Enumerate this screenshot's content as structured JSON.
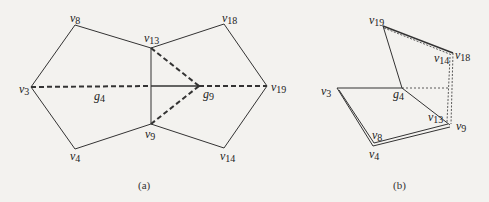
{
  "figure": {
    "panels": [
      {
        "id": "a",
        "caption": "(a)",
        "vertices": {
          "v8": {
            "label": "v",
            "sub": "8",
            "x": 75,
            "y": 25
          },
          "v13": {
            "label": "v",
            "sub": "13",
            "x": 151,
            "y": 48
          },
          "v18": {
            "label": "v",
            "sub": "18",
            "x": 224,
            "y": 24
          },
          "v3": {
            "label": "v",
            "sub": "3",
            "x": 31,
            "y": 87
          },
          "g9": {
            "label": "g",
            "sub": "9",
            "x": 199,
            "y": 86
          },
          "v19": {
            "label": "v",
            "sub": "19",
            "x": 267,
            "y": 86
          },
          "v9": {
            "label": "v",
            "sub": "9",
            "x": 151,
            "y": 124
          },
          "v4": {
            "label": "v",
            "sub": "4",
            "x": 75,
            "y": 149
          },
          "v14": {
            "label": "v",
            "sub": "14",
            "x": 224,
            "y": 148
          },
          "g4": {
            "label": "g",
            "sub": "4"
          }
        },
        "solid_edges": [
          [
            "v3",
            "v8"
          ],
          [
            "v8",
            "v13"
          ],
          [
            "v13",
            "v18"
          ],
          [
            "v18",
            "v19"
          ],
          [
            "v19",
            "v14"
          ],
          [
            "v14",
            "v9"
          ],
          [
            "v9",
            "v4"
          ],
          [
            "v4",
            "v3"
          ],
          [
            "v13",
            "v9"
          ]
        ],
        "dashed_edges": [
          [
            "v3",
            "g9"
          ],
          [
            "g9",
            "v19"
          ],
          [
            "v13",
            "g9"
          ],
          [
            "v9",
            "g9"
          ]
        ]
      },
      {
        "id": "b",
        "caption": "(b)",
        "vertices": {
          "v19": {
            "label": "v",
            "sub": "19"
          },
          "v18": {
            "label": "v",
            "sub": "18"
          },
          "v14": {
            "label": "v",
            "sub": "14"
          },
          "v3": {
            "label": "v",
            "sub": "3"
          },
          "g4": {
            "label": "g",
            "sub": "4"
          },
          "v13": {
            "label": "v",
            "sub": "13"
          },
          "v9": {
            "label": "v",
            "sub": "9"
          },
          "v8": {
            "label": "v",
            "sub": "8"
          },
          "v4": {
            "label": "v",
            "sub": "4"
          }
        }
      }
    ]
  }
}
